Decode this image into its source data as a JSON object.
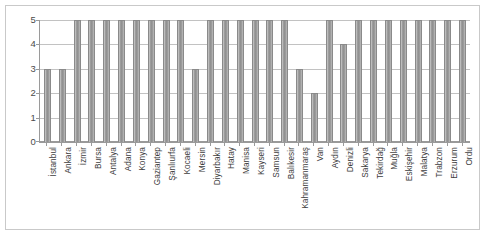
{
  "chart_data": {
    "type": "bar",
    "title": "",
    "subtitle": "",
    "xlabel": "",
    "ylabel": "",
    "ylim": [
      0,
      5
    ],
    "yticks": [
      0,
      1,
      2,
      3,
      4,
      5
    ],
    "ytick_labels": [
      "0",
      "1",
      "2",
      "3",
      "4",
      "5"
    ],
    "grid": true,
    "legend": false,
    "legend_position": "none",
    "bar_color": "#9c9c9c",
    "bar_border_color": "#8a8a8a",
    "gridline_color": "#c2c2c2",
    "axis_color": "#9a9a9a",
    "plot_background": "#ffffff",
    "frame_border_color": "#c9c9c9",
    "categories": [
      "İstanbul",
      "Ankara",
      "İzmir",
      "Bursa",
      "Antalya",
      "Adana",
      "Konya",
      "Gaziantep",
      "Şanlıurfa",
      "Kocaeli",
      "Mersin",
      "Diyarbakır",
      "Hatay",
      "Manisa",
      "Kayseri",
      "Samsun",
      "Balıkesir",
      "Kahramanmaraş",
      "Van",
      "Aydın",
      "Denizli",
      "Sakarya",
      "Tekirdağ",
      "Muğla",
      "Eskişehir",
      "Malatya",
      "Trabzon",
      "Erzurum",
      "Ordu"
    ],
    "values": [
      3,
      3,
      5,
      5,
      5,
      5,
      5,
      5,
      5,
      5,
      3,
      5,
      5,
      5,
      5,
      5,
      5,
      3,
      2,
      5,
      4,
      5,
      5,
      5,
      5,
      5,
      5,
      5,
      5
    ]
  }
}
